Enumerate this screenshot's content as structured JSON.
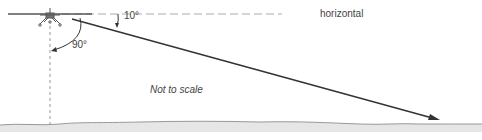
{
  "diagram": {
    "labels": {
      "horizontal": "horizontal",
      "depression_angle": "10°",
      "vertical_angle": "90°",
      "scale_note": "Not to scale"
    },
    "elements": [
      "aircraft-front-view",
      "horizontal-reference-dashed-line",
      "vertical-reference-dashed-line",
      "line-of-sight-arrow",
      "ground-surface"
    ],
    "colors": {
      "line": "#333333",
      "dashed": "#aaaaaa",
      "ground_fill": "#e6e6e6",
      "ground_edge": "#999999",
      "text": "#444444"
    }
  }
}
